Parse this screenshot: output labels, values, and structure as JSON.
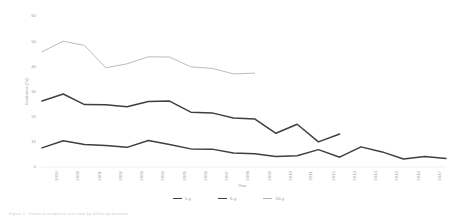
{
  "chart_data": {
    "type": "line",
    "title": "",
    "xlabel": "Year",
    "ylabel": "Incidence (%)",
    "xlim": [
      1999,
      2018
    ],
    "ylim": [
      0,
      60
    ],
    "yticks": [
      0,
      10,
      20,
      30,
      40,
      50,
      60
    ],
    "ytick_labels": [
      "0",
      "10",
      "20",
      "30",
      "40",
      "50",
      "60"
    ],
    "categories": [
      1999,
      2000,
      2001,
      2002,
      2003,
      2004,
      2005,
      2006,
      2007,
      2008,
      2009,
      2010,
      2011,
      2012,
      2013,
      2014,
      2015,
      2016,
      2017,
      2018
    ],
    "xtick_labels": [
      "1999",
      "2000",
      "2001",
      "2002",
      "2003",
      "2004",
      "2005",
      "2006",
      "2007",
      "2008",
      "2009",
      "2010",
      "2011",
      "2012",
      "2013",
      "2014",
      "2015",
      "2016",
      "2017",
      "2018"
    ],
    "grid": false,
    "legend_position": "bottom-center",
    "series": [
      {
        "name": "1-y",
        "color": "#3f3f3f",
        "values": [
          7.6,
          10.4,
          8.9,
          8.5,
          7.8,
          10.5,
          8.9,
          7.2,
          7.1,
          5.6,
          5.3,
          4.2,
          4.5,
          6.9,
          3.9,
          8.0,
          6.0,
          3.2,
          4.2,
          3.4
        ]
      },
      {
        "name": "5-y",
        "color": "#3f3f3f",
        "values": [
          26.2,
          29.0,
          24.8,
          24.7,
          23.9,
          26.0,
          26.2,
          21.8,
          21.5,
          19.5,
          19.1,
          13.4,
          17.0,
          10.0,
          13.1,
          null,
          null,
          null,
          null,
          null
        ]
      },
      {
        "name": "10-y",
        "color": "#b4b4b4",
        "values": [
          45.8,
          50.0,
          48.3,
          39.4,
          41.0,
          43.8,
          43.7,
          39.8,
          39.2,
          37.0,
          37.3,
          null,
          null,
          null,
          null,
          null,
          null,
          null,
          null,
          null
        ]
      }
    ],
    "legend": [
      {
        "label": "1-y",
        "color": "#3f3f3f",
        "width": 1.6
      },
      {
        "label": "5-y",
        "color": "#3f3f3f",
        "width": 1.6
      },
      {
        "label": "10-y",
        "color": "#b4b4b4",
        "width": 1.0
      }
    ]
  },
  "caption": {
    "text": "Figure 1. Trends in incidence over time by follow-up duration."
  }
}
